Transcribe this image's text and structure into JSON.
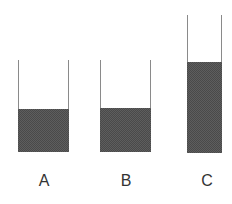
{
  "diagram": {
    "fill_color": "#5e5e5e",
    "wall_color": "#8a8a8a",
    "containers": [
      {
        "label": "A",
        "left": 18,
        "width": 50,
        "top": 60,
        "bottom": 152,
        "fill_top": 109
      },
      {
        "label": "B",
        "left": 100,
        "width": 50,
        "top": 60,
        "bottom": 152,
        "fill_top": 108
      },
      {
        "label": "C",
        "left": 187,
        "width": 34,
        "top": 15,
        "bottom": 153,
        "fill_top": 62
      }
    ]
  }
}
